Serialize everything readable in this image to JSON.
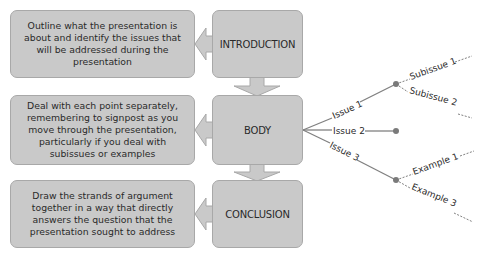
{
  "stages": [
    {
      "label": "INTRODUCTION",
      "description": "Outline what the presentation is about and identify the issues that will be addressed during the presentation"
    },
    {
      "label": "BODY",
      "description": "Deal with each point separately, remembering to signpost as you move through the presentation, particularly if you deal with subissues or examples"
    },
    {
      "label": "CONCLUSION",
      "description": "Draw the strands of argument together in a way that directly answers the question that the presentation sought to address"
    }
  ],
  "tree": {
    "issues": [
      {
        "label": "Issue 1",
        "children": [
          "Subissue 1",
          "Subissue 2"
        ]
      },
      {
        "label": "Issue 2",
        "children": []
      },
      {
        "label": "Issue 3",
        "children": [
          "Example 1",
          "Example 3"
        ]
      }
    ]
  },
  "colors": {
    "box_fill": "#c9c9c9",
    "box_border": "#a8a8a8",
    "line": "#808080",
    "node": "#7a7a7a"
  }
}
